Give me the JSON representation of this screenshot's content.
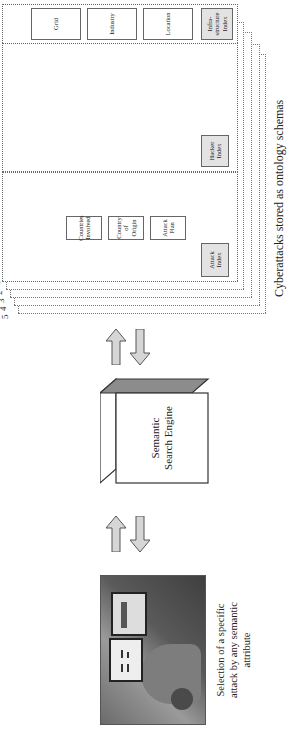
{
  "title": "Cyberattacks stored as ontology schemas",
  "engine": {
    "label_line1": "Semantic",
    "label_line2": "Search Engine"
  },
  "caption": {
    "line1": "Selection of a specific",
    "line2": "attack by any semantic",
    "line3": "attribute"
  },
  "layers": [
    "1",
    "2",
    "3",
    "4",
    "5"
  ],
  "attack_panel": {
    "index": "Attack Index",
    "rows": [
      [
        "Attack Plan",
        "Country of Origin",
        "Countries Involved"
      ],
      [
        "Attack Type",
        "Infra-structure",
        "Targeted Platform"
      ],
      [
        "Attack Time",
        "Means of Access",
        ""
      ],
      [
        "Tools",
        "Technology Used",
        "Payload"
      ],
      [
        "Alarm",
        "Outcome",
        ""
      ],
      [
        "Impact",
        "Recovery",
        "Forensics"
      ]
    ]
  },
  "hacker_panel": {
    "index": "Hacker Index",
    "rows": [
      [
        "Criminal Organization",
        "U.S. Entry",
        ""
      ],
      [
        "Target Location",
        "U.S. Education",
        ""
      ],
      [
        "Hacker",
        "Motives",
        ""
      ],
      [
        "Alias",
        "U.S. Entry",
        "Work Visa"
      ],
      [
        "Background",
        "U.S. Education",
        "Skills"
      ],
      [
        "Criminal History",
        "Motives",
        ""
      ]
    ]
  },
  "infrastructure_panel": {
    "index": "Infra-structure Index",
    "items": [
      "Location",
      "Industry",
      "Grid"
    ]
  },
  "colors": {
    "index_fill": "#e3e3e3",
    "arrow_fill": "#d6d6d6",
    "engine_top": "#8c8c8c"
  }
}
